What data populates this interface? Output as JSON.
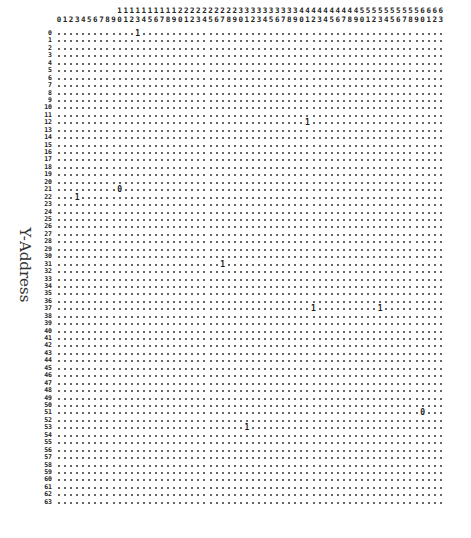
{
  "axis": {
    "y_label": "Y-Address",
    "x_columns": 64,
    "y_rows": 64,
    "x_range": [
      0,
      63
    ],
    "y_range": [
      0,
      63
    ]
  },
  "grid": {
    "empty_symbol": ".",
    "markers": [
      {
        "row": 0,
        "col": 13,
        "value": "1"
      },
      {
        "row": 12,
        "col": 41,
        "value": "1"
      },
      {
        "row": 21,
        "col": 10,
        "value": "0"
      },
      {
        "row": 22,
        "col": 3,
        "value": "1"
      },
      {
        "row": 31,
        "col": 27,
        "value": "1"
      },
      {
        "row": 37,
        "col": 42,
        "value": "1"
      },
      {
        "row": 37,
        "col": 53,
        "value": "1"
      },
      {
        "row": 51,
        "col": 60,
        "value": "0"
      },
      {
        "row": 53,
        "col": 31,
        "value": "1"
      }
    ]
  },
  "colors": {
    "ink": "#1a1a1a",
    "background": "#ffffff"
  }
}
